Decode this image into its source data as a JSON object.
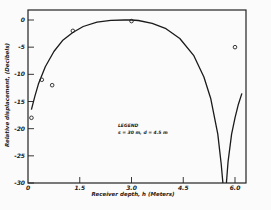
{
  "chart_data": {
    "type": "line",
    "title": "",
    "xlabel": "Receiver depth, h (Meters)",
    "ylabel": "Relative displacement, (Decibels)",
    "xlim": [
      0,
      6.6
    ],
    "ylim": [
      -30,
      2
    ],
    "x_ticks": [
      0,
      1.5,
      3.0,
      4.5,
      6.0
    ],
    "x_tick_labels": [
      "0",
      "1.5",
      "3.0",
      "4.5",
      "6.0"
    ],
    "y_ticks": [
      0,
      -5,
      -10,
      -15,
      -20,
      -25,
      -30
    ],
    "y_tick_labels": [
      "0",
      "-5",
      "-10",
      "-15",
      "-20",
      "-25",
      "-30"
    ],
    "legend": {
      "title": "LEGEND",
      "entries": [
        "s = 30 m, d = 4.5 m"
      ],
      "placement": "center-bottom"
    },
    "series": [
      {
        "name": "theory",
        "kind": "curve",
        "x": [
          0.1,
          0.2,
          0.3,
          0.5,
          0.75,
          1.0,
          1.3,
          1.6,
          2.0,
          2.4,
          2.8,
          3.0,
          3.2,
          3.6,
          4.0,
          4.4,
          4.8,
          5.1,
          5.3,
          5.5,
          5.6,
          5.65
        ],
        "y": [
          -16.5,
          -14.0,
          -11.8,
          -8.6,
          -5.8,
          -3.8,
          -2.3,
          -1.2,
          -0.4,
          -0.05,
          0.0,
          0.0,
          -0.1,
          -0.6,
          -1.6,
          -3.4,
          -6.5,
          -10.5,
          -14.5,
          -21.0,
          -26.5,
          -30.0
        ]
      },
      {
        "name": "theory-right-branch",
        "kind": "curve",
        "x": [
          5.75,
          5.8,
          5.9,
          6.0,
          6.1,
          6.2
        ],
        "y": [
          -30.0,
          -26.0,
          -21.0,
          -18.0,
          -15.5,
          -13.5
        ]
      },
      {
        "name": "measured",
        "kind": "scatter",
        "x": [
          0.1,
          0.4,
          0.7,
          1.3,
          3.0,
          6.0
        ],
        "y": [
          -18.0,
          -11.0,
          -12.0,
          -2.0,
          -0.2,
          -5.0
        ]
      }
    ],
    "grid": false
  }
}
